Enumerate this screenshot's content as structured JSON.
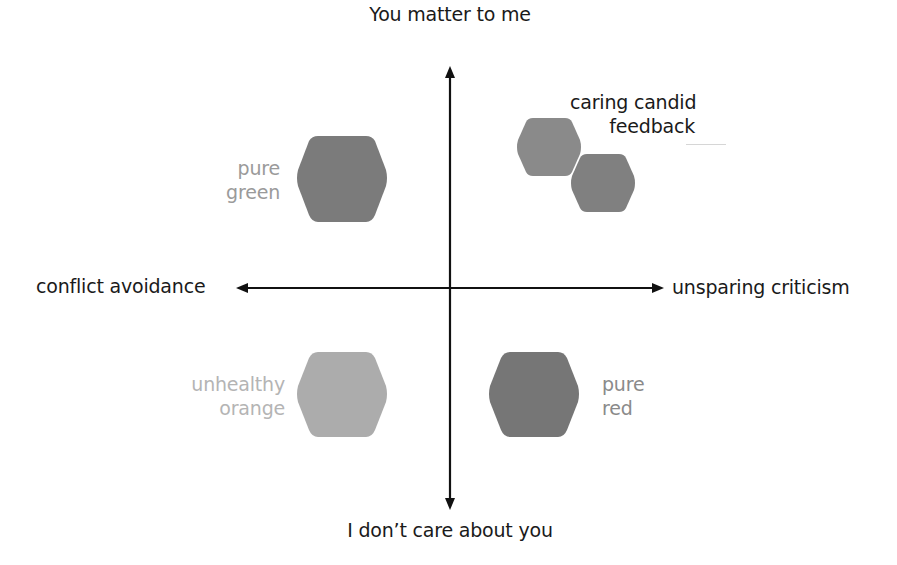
{
  "diagram": {
    "type": "quadrant",
    "axes": {
      "vertical": {
        "top_label": "You matter to me",
        "bottom_label": "I don’t care about you"
      },
      "horizontal": {
        "left_label": "conflict avoidance",
        "right_label": "unsparing criticism"
      }
    },
    "quadrants": {
      "top_left": {
        "label_line1": "pure",
        "label_line2": "green",
        "color": "#7b7b7b"
      },
      "top_right": {
        "label_line1": "caring candid",
        "label_line2": "feedback",
        "color": "#8a8a8a",
        "icon": "two-hexagons"
      },
      "bottom_left": {
        "label_line1": "unhealthy",
        "label_line2": "orange",
        "color": "#acacac"
      },
      "bottom_right": {
        "label_line1": "pure",
        "label_line2": "red",
        "color": "#767676"
      }
    },
    "colors": {
      "axis": "#111111",
      "background": "#ffffff"
    }
  }
}
